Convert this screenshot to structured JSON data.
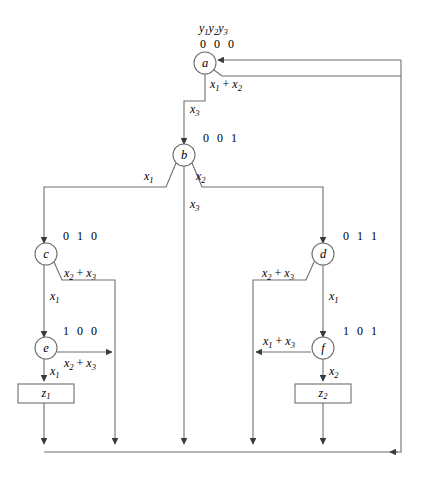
{
  "diagram": {
    "type": "state-transition-diagram",
    "title_label": "y1y2y3",
    "state_variables": [
      "y1",
      "y2",
      "y3"
    ],
    "states": [
      {
        "id": "a",
        "label": "a",
        "code": "0 0 0",
        "cx": 205,
        "cy": 63,
        "r": 11
      },
      {
        "id": "b",
        "label": "b",
        "code": "0 0 1",
        "cx": 184,
        "cy": 155,
        "r": 11
      },
      {
        "id": "c",
        "label": "c",
        "code": "0 1 0",
        "cx": 46,
        "cy": 254,
        "r": 11
      },
      {
        "id": "d",
        "label": "d",
        "code": "0 1 1",
        "cx": 323,
        "cy": 254,
        "r": 11
      },
      {
        "id": "e",
        "label": "e",
        "code": "1 0 0",
        "cx": 46,
        "cy": 348,
        "r": 11
      },
      {
        "id": "f",
        "label": "f",
        "code": "1 0 1",
        "cx": 323,
        "cy": 348,
        "r": 11
      }
    ],
    "outputs": [
      {
        "id": "z1",
        "label": "z1",
        "x": 18,
        "y": 384,
        "w": 56,
        "h": 19
      },
      {
        "id": "z2",
        "label": "z2",
        "x": 295,
        "y": 384,
        "w": 56,
        "h": 19
      }
    ],
    "transitions": [
      {
        "from": "a",
        "to": "b",
        "condition": "x3",
        "label_x": 190,
        "label_y": 110
      },
      {
        "from": "a",
        "to": "bus",
        "condition": "x1 + x2",
        "label_x": 210,
        "label_y": 83
      },
      {
        "from": "b",
        "to": "c",
        "condition": "x1",
        "label_x": 144,
        "label_y": 176
      },
      {
        "from": "b",
        "to": "d",
        "condition": "x2",
        "label_x": 193,
        "label_y": 176
      },
      {
        "from": "b",
        "to": "bus",
        "condition": "x3",
        "label_x": 190,
        "label_y": 204
      },
      {
        "from": "c",
        "to": "e",
        "condition": "x1",
        "label_x": 48,
        "label_y": 296
      },
      {
        "from": "c",
        "to": "bus",
        "condition": "x2 + x3",
        "label_x": 65,
        "label_y": 274
      },
      {
        "from": "d",
        "to": "f",
        "condition": "x1",
        "label_x": 329,
        "label_y": 296
      },
      {
        "from": "d",
        "to": "bus",
        "condition": "x2 + x3",
        "label_x": 264,
        "label_y": 274
      },
      {
        "from": "e",
        "to": "z1",
        "condition": "x1",
        "label_x": 48,
        "label_y": 371
      },
      {
        "from": "e",
        "to": "bus",
        "condition": "x2 + x3",
        "label_x": 65,
        "label_y": 363
      },
      {
        "from": "f",
        "to": "z2",
        "condition": "x2",
        "label_x": 329,
        "label_y": 371
      },
      {
        "from": "f",
        "to": "bus",
        "condition": "x1 + x3",
        "label_x": 265,
        "label_y": 341
      }
    ],
    "edge_label_glyphs": {
      "x1": {
        "base": "x",
        "sub": "1"
      },
      "x2": {
        "base": "x",
        "sub": "2"
      },
      "x3": {
        "base": "x",
        "sub": "3"
      },
      "x1_plus_x2": "x1 + x2",
      "x1_plus_x3": "x1 + x3",
      "x2_plus_x3": "x2 + x3"
    },
    "bus": {
      "y": 452,
      "x_start": 44,
      "x_end": 401,
      "drop_columns": [
        44,
        115,
        184,
        253,
        323
      ],
      "return_column": 401,
      "return_top_y": 60
    },
    "colors": {
      "line": "#6f6f6f",
      "text": "#000000",
      "background": "#ffffff"
    }
  }
}
